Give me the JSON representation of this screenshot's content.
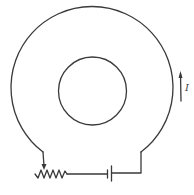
{
  "diagram": {
    "components": {
      "outer_loop": "outer-coil-loop",
      "inner_circle": "inner-circle",
      "resistor": "variable-resistor",
      "battery": "battery-cell",
      "current_arrow": "current-direction-arrow"
    },
    "current_label": "I",
    "stroke_color": "#3a3a3a",
    "background": "#ffffff"
  }
}
